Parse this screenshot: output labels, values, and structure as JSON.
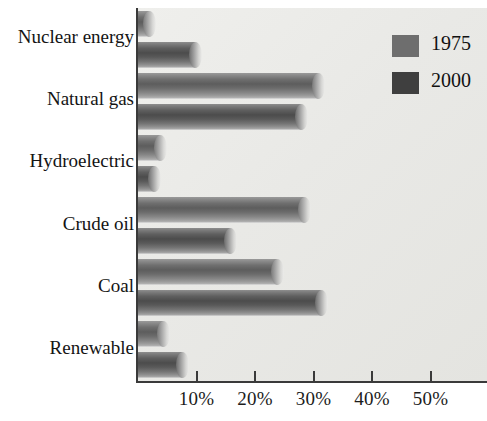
{
  "chart_data": {
    "type": "bar",
    "orientation": "horizontal",
    "title": "",
    "xlabel": "",
    "ylabel": "",
    "categories": [
      "Nuclear energy",
      "Natural gas",
      "Hydroelectric",
      "Crude oil",
      "Coal",
      "Renewable"
    ],
    "series": [
      {
        "name": "1975",
        "color": "#6e6e6e",
        "values": [
          3,
          32,
          5,
          29.5,
          25,
          5.5
        ]
      },
      {
        "name": "2000",
        "color": "#3f3f3f",
        "values": [
          11,
          29,
          4,
          17,
          32.5,
          8.8
        ]
      }
    ],
    "xlim": [
      0,
      59.7
    ],
    "xticks": [
      10,
      20,
      30,
      40,
      50
    ],
    "xtick_labels": [
      "10%",
      "20%",
      "30%",
      "40%",
      "50%"
    ],
    "grid": false,
    "legend_position": "top-right",
    "legend_entries": [
      "1975",
      "2000"
    ],
    "plot_background": "#eaeae7",
    "axis_color": "#3a3a3a"
  }
}
